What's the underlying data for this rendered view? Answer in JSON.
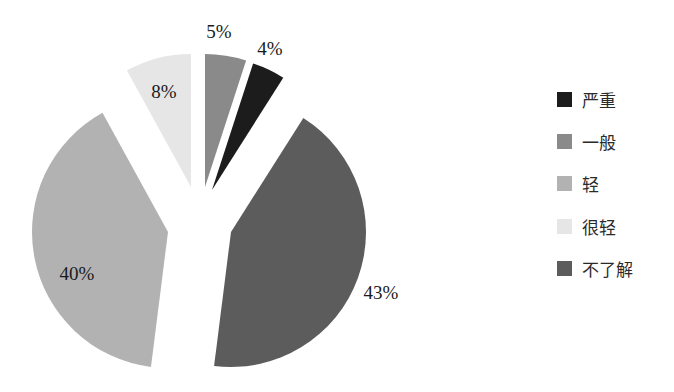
{
  "chart_data": {
    "type": "pie",
    "exploded": true,
    "title": "",
    "categories": [
      "严重",
      "一般",
      "轻",
      "很轻",
      "不了解"
    ],
    "values": [
      4,
      5,
      40,
      8,
      43
    ],
    "labels": [
      "4%",
      "5%",
      "40%",
      "8%",
      "43%"
    ],
    "colors": [
      "#1c1c1c",
      "#8a8a8a",
      "#b2b2b2",
      "#e6e6e6",
      "#5c5c5c"
    ],
    "legend_position": "right",
    "slice_order_clockwise_from_top": [
      "一般",
      "严重",
      "不了解",
      "轻",
      "很轻"
    ]
  },
  "legend": {
    "items": [
      {
        "label": "严重",
        "color": "#1c1c1c"
      },
      {
        "label": "一般",
        "color": "#8a8a8a"
      },
      {
        "label": "轻",
        "color": "#b2b2b2"
      },
      {
        "label": "很轻",
        "color": "#e6e6e6"
      },
      {
        "label": "不了解",
        "color": "#5c5c5c"
      }
    ]
  },
  "slices": [
    {
      "name": "一般",
      "pct": 5,
      "label": "5%",
      "color": "#8a8a8a",
      "start": 0,
      "end": 18,
      "cx": 205,
      "cy": 187,
      "r": 133,
      "lx": 219,
      "ly": 34
    },
    {
      "name": "严重",
      "pct": 4,
      "label": "4%",
      "color": "#1c1c1c",
      "start": 18,
      "end": 32.4,
      "cx": 212,
      "cy": 190,
      "r": 133,
      "lx": 270,
      "ly": 51
    },
    {
      "name": "不了解",
      "pct": 43,
      "label": "43%",
      "color": "#5c5c5c",
      "start": 32.4,
      "end": 187.2,
      "cx": 231,
      "cy": 232,
      "r": 135,
      "lx": 381,
      "ly": 295
    },
    {
      "name": "轻",
      "pct": 40,
      "label": "40%",
      "color": "#b2b2b2",
      "start": 187.2,
      "end": 331.2,
      "cx": 168,
      "cy": 232,
      "r": 136,
      "lx": 77,
      "ly": 276
    },
    {
      "name": "很轻",
      "pct": 8,
      "label": "8%",
      "color": "#e6e6e6",
      "start": 331.2,
      "end": 360,
      "cx": 191,
      "cy": 187,
      "r": 133,
      "lx": 164,
      "ly": 94
    }
  ]
}
